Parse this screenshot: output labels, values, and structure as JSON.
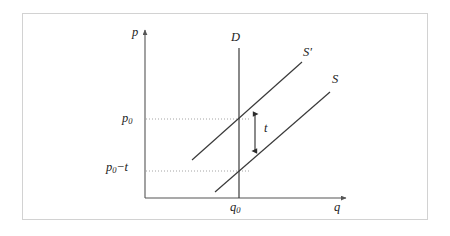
{
  "figure": {
    "type": "economics-supply-demand-tax-diagram",
    "frame": {
      "x": 22,
      "y": 13,
      "width": 406,
      "height": 207,
      "border_color": "#d2d2d2"
    },
    "background_color": "#ffffff",
    "line_color": "#3a3a3a",
    "axis_color": "#555555",
    "guide_color": "#9a9a9a"
  },
  "axes": {
    "x_label": "q",
    "y_label": "p",
    "origin": {
      "x": 145,
      "y": 198
    },
    "x_end": {
      "x": 348,
      "y": 198
    },
    "y_end": {
      "x": 145,
      "y": 28
    }
  },
  "curves": [
    {
      "name": "demand",
      "label": "D",
      "shape": "vertical",
      "from": {
        "x": 239,
        "y": 48
      },
      "to": {
        "x": 239,
        "y": 198
      },
      "label_pos": {
        "x": 231,
        "y": 31
      }
    },
    {
      "name": "supply-after-tax",
      "label": "S'",
      "shape": "line",
      "from": {
        "x": 192,
        "y": 160
      },
      "to": {
        "x": 302,
        "y": 62
      },
      "label_pos": {
        "x": 303,
        "y": 46
      }
    },
    {
      "name": "supply-before-tax",
      "label": "S",
      "shape": "line",
      "from": {
        "x": 215,
        "y": 192
      },
      "to": {
        "x": 330,
        "y": 92
      },
      "label_pos": {
        "x": 332,
        "y": 73
      }
    }
  ],
  "guides": [
    {
      "name": "p0-guide",
      "label": "p0",
      "label_main": "p",
      "label_sub": "0",
      "from": {
        "x": 146,
        "y": 119
      },
      "to": {
        "x": 250,
        "y": 119
      },
      "style": "dotted"
    },
    {
      "name": "p0-minus-t-guide",
      "label": "p0-t",
      "label_main": "p",
      "label_sub": "0",
      "label_op": "−",
      "label_tail": "t",
      "from": {
        "x": 146,
        "y": 171
      },
      "to": {
        "x": 250,
        "y": 171
      },
      "style": "dotted"
    }
  ],
  "annotations": [
    {
      "name": "tax-wedge",
      "label": "t",
      "type": "double-headed-arrow",
      "from": {
        "x": 255,
        "y": 113
      },
      "to": {
        "x": 255,
        "y": 152
      },
      "label_pos": {
        "x": 264,
        "y": 122
      }
    }
  ],
  "ticks": {
    "x": [
      {
        "label": "q0",
        "label_main": "q",
        "label_sub": "0",
        "x": 239
      }
    ],
    "y": [
      {
        "label": "p0",
        "label_main": "p",
        "label_sub": "0",
        "y": 119
      },
      {
        "label": "p0-t",
        "label_main": "p",
        "label_sub": "0",
        "y": 171
      }
    ]
  },
  "labels": {
    "y_axis": "p",
    "x_axis": "q",
    "demand": "D",
    "supply_taxed": "S",
    "supply_taxed_prime": "′",
    "supply": "S",
    "price_main": "p",
    "price_sub": "0",
    "minus": "−",
    "tax": "t",
    "quantity_main": "q",
    "quantity_sub": "0"
  }
}
